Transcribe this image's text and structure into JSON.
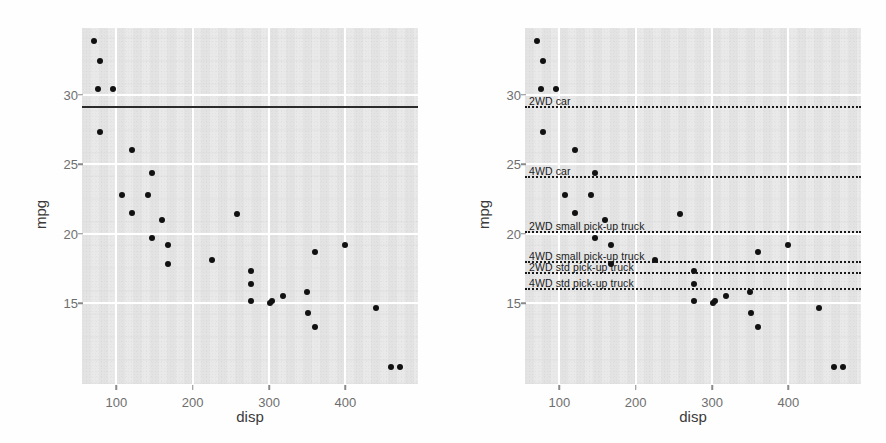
{
  "figure": {
    "panels": [
      "left",
      "right"
    ],
    "background_color": "#e9e9e9",
    "gridline_color": "#ffffff",
    "point_color": "#111111"
  },
  "axis": {
    "xlabel": "disp",
    "ylabel": "mpg",
    "xticks": [
      100,
      200,
      300,
      400
    ],
    "xtick_labels": [
      "100",
      "200",
      "300",
      "400"
    ],
    "yticks": [
      15,
      20,
      25,
      30
    ],
    "ytick_labels": [
      "15",
      "20",
      "25",
      "30"
    ],
    "xlim": [
      55,
      495
    ],
    "ylim": [
      9.2,
      34.8
    ]
  },
  "chart_data": {
    "type": "scatter",
    "title": "",
    "xlabel": "disp",
    "ylabel": "mpg",
    "xlim": [
      55,
      495
    ],
    "ylim": [
      9.2,
      34.8
    ],
    "grid": true,
    "legend": "none",
    "xticks": [
      100,
      200,
      300,
      400
    ],
    "yticks": [
      15,
      20,
      25,
      30
    ],
    "points": [
      {
        "x": 71.1,
        "y": 33.9
      },
      {
        "x": 78.7,
        "y": 32.4
      },
      {
        "x": 75.7,
        "y": 30.4
      },
      {
        "x": 95.1,
        "y": 30.4
      },
      {
        "x": 79.0,
        "y": 27.3
      },
      {
        "x": 120.1,
        "y": 26.0
      },
      {
        "x": 146.7,
        "y": 24.4
      },
      {
        "x": 108.0,
        "y": 22.8
      },
      {
        "x": 140.8,
        "y": 22.8
      },
      {
        "x": 120.3,
        "y": 21.5
      },
      {
        "x": 258.0,
        "y": 21.4
      },
      {
        "x": 160.0,
        "y": 21.0
      },
      {
        "x": 146.7,
        "y": 19.7
      },
      {
        "x": 167.6,
        "y": 19.2
      },
      {
        "x": 400.0,
        "y": 19.2
      },
      {
        "x": 360.0,
        "y": 18.7
      },
      {
        "x": 225.0,
        "y": 18.1
      },
      {
        "x": 167.6,
        "y": 17.8
      },
      {
        "x": 275.8,
        "y": 17.3
      },
      {
        "x": 275.8,
        "y": 16.4
      },
      {
        "x": 350.0,
        "y": 15.8
      },
      {
        "x": 318.0,
        "y": 15.5
      },
      {
        "x": 304.0,
        "y": 15.2
      },
      {
        "x": 275.8,
        "y": 15.2
      },
      {
        "x": 301.0,
        "y": 15.0
      },
      {
        "x": 440.0,
        "y": 14.7
      },
      {
        "x": 351.0,
        "y": 14.3
      },
      {
        "x": 360.0,
        "y": 13.3
      },
      {
        "x": 460.0,
        "y": 10.4
      },
      {
        "x": 472.0,
        "y": 10.4
      }
    ],
    "reference_lines_left": [
      {
        "y": 29.1,
        "style": "solid",
        "label": ""
      }
    ],
    "reference_lines_right": [
      {
        "y": 29.1,
        "style": "dotted",
        "label": "2WD car"
      },
      {
        "y": 24.1,
        "style": "dotted",
        "label": "4WD car"
      },
      {
        "y": 20.1,
        "style": "dotted",
        "label": "2WD small pick-up truck"
      },
      {
        "y": 18.0,
        "style": "dotted",
        "label": "4WD small pick-up truck"
      },
      {
        "y": 17.2,
        "style": "dotted",
        "label": "2WD std pick-up truck"
      },
      {
        "y": 16.0,
        "style": "dotted",
        "label": "4WD std pick-up truck"
      }
    ]
  }
}
